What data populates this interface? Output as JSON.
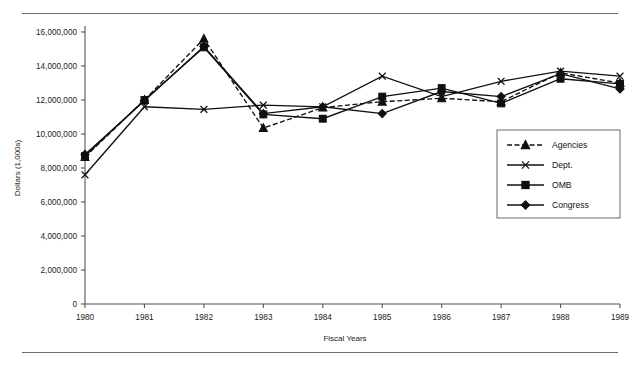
{
  "figure": {
    "has_top_rule": true,
    "has_bottom_rule": true,
    "rule_color": "#6e6e6e",
    "background": "#ffffff"
  },
  "chart_data": {
    "type": "line",
    "title": "",
    "xlabel": "Fiscal Years",
    "ylabel": "Dollars (1,000s)",
    "categories": [
      "1980",
      "1981",
      "1982",
      "1983",
      "1984",
      "1985",
      "1986",
      "1987",
      "1988",
      "1989"
    ],
    "ylim": [
      0,
      16000000
    ],
    "ytick_values": [
      0,
      2000000,
      4000000,
      6000000,
      8000000,
      10000000,
      12000000,
      14000000,
      16000000
    ],
    "ytick_labels": [
      "0",
      "2,000,000",
      "4,000,000",
      "6,000,000",
      "8,000,000",
      "10,000,000",
      "12,000,000",
      "14,000,000",
      "16,000,000"
    ],
    "grid": false,
    "legend_position": "right",
    "series": [
      {
        "name": "Agencies",
        "marker": "triangle",
        "dash": "dashed",
        "color": "#101010",
        "values": [
          8650000,
          12000000,
          15600000,
          10350000,
          11550000,
          11900000,
          12100000,
          11900000,
          13600000,
          13000000
        ]
      },
      {
        "name": "Dept.",
        "marker": "x",
        "dash": "solid",
        "color": "#101010",
        "values": [
          7600000,
          11600000,
          11450000,
          11700000,
          11600000,
          13400000,
          12200000,
          13100000,
          13700000,
          13400000
        ]
      },
      {
        "name": "OMB",
        "marker": "square",
        "dash": "solid",
        "color": "#101010",
        "values": [
          8700000,
          12000000,
          15100000,
          11150000,
          10900000,
          12200000,
          12700000,
          11800000,
          13250000,
          12950000
        ]
      },
      {
        "name": "Congress",
        "marker": "diamond",
        "dash": "solid",
        "color": "#101010",
        "values": [
          8800000,
          11950000,
          15150000,
          11200000,
          11600000,
          11200000,
          12500000,
          12200000,
          13550000,
          12650000
        ]
      }
    ]
  },
  "legend": {
    "entries": [
      {
        "label": "Agencies"
      },
      {
        "label": "Dept."
      },
      {
        "label": "OMB"
      },
      {
        "label": "Congress"
      }
    ]
  }
}
